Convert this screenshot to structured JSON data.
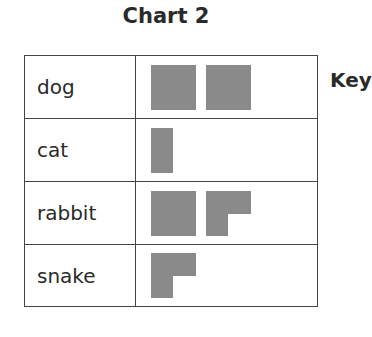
{
  "title": "Chart 2",
  "key_label": "Key",
  "colors": {
    "icon": "#8a8a8a",
    "border": "#444444",
    "text": "#2a2a2a"
  },
  "rows": [
    {
      "label": "dog",
      "icons": [
        "full",
        "full"
      ]
    },
    {
      "label": "cat",
      "icons": [
        "half"
      ]
    },
    {
      "label": "rabbit",
      "icons": [
        "full",
        "three-quarter"
      ]
    },
    {
      "label": "snake",
      "icons": [
        "three-quarter"
      ]
    }
  ],
  "chart_data": {
    "type": "table",
    "subtype": "pictogram",
    "title": "Chart 2",
    "categories": [
      "dog",
      "cat",
      "rabbit",
      "snake"
    ],
    "values_in_icons": [
      2,
      0.5,
      1.75,
      0.75
    ],
    "legend": "Key (partially visible, value per icon not shown)",
    "xlabel": "",
    "ylabel": ""
  }
}
